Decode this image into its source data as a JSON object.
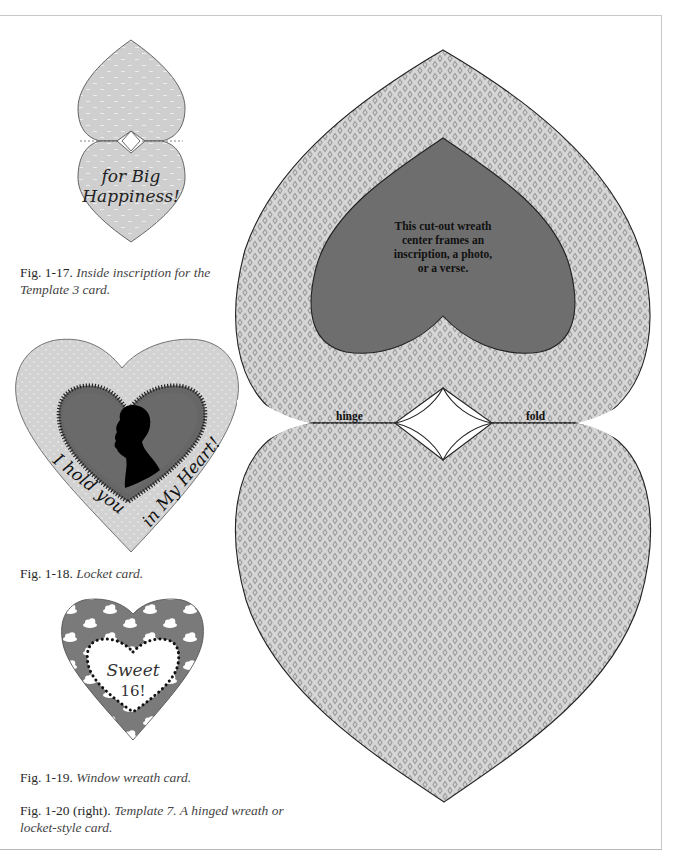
{
  "colors": {
    "pattern_bg": "#d6d6d6",
    "pattern_diamond": "#9a9a9a",
    "inner_heart": "#6e6e6e",
    "outline": "#2a2a2a",
    "small_card": "#cfcfcf",
    "locket_bg": "#d2d2d2",
    "locket_inner": "#6a6a6a",
    "wreath_bg": "#7a7a7a"
  },
  "figures": {
    "fig17": {
      "label": "Fig. 1-17.",
      "description": "Inside inscription for the Template 3 card.",
      "inscription_line1": "for Big",
      "inscription_line2": "Happiness!"
    },
    "fig18": {
      "label": "Fig. 1-18.",
      "description": "Locket card.",
      "text_left": "I hold you",
      "text_right": "in My Heart!"
    },
    "fig19": {
      "label": "Fig. 1-19.",
      "description": "Window wreath card.",
      "inscription_line1": "Sweet",
      "inscription_line2": "16!"
    },
    "fig20": {
      "label": "Fig. 1-20 (right).",
      "description": "Template 7. A hinged wreath or locket-style card.",
      "center_text": [
        "This cut-out wreath",
        "center frames an",
        "inscription, a photo,",
        "or a verse."
      ],
      "hinge_label": "hinge",
      "fold_label": "fold"
    }
  }
}
